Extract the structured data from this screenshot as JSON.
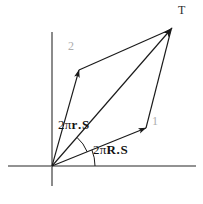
{
  "figure": {
    "name": "vector-parallelogram-diagram",
    "background": "#ffffff",
    "width": 203,
    "height": 204,
    "colors": {
      "axis": "#6e6e6e",
      "vector": "#1a1a1a",
      "arc": "#1a1a1a",
      "label_gray": "#adadad",
      "label_dark": "#111111"
    },
    "axes": {
      "origin": {
        "x": 52,
        "y": 166
      },
      "horizontal": {
        "x1": 8,
        "y1": 166,
        "x2": 196,
        "y2": 166
      },
      "vertical": {
        "x1": 52,
        "y1": 32,
        "x2": 52,
        "y2": 186
      }
    },
    "vectors": [
      {
        "id": "vector-1",
        "label": "1",
        "label_color": "#adadad",
        "from": {
          "x": 52,
          "y": 166
        },
        "to": {
          "x": 146,
          "y": 128
        }
      },
      {
        "id": "vector-2",
        "label": "2",
        "label_color": "#adadad",
        "from": {
          "x": 52,
          "y": 166
        },
        "to": {
          "x": 79,
          "y": 70
        }
      },
      {
        "id": "vector-T",
        "label": "T",
        "label_color": "#2b2b2b",
        "from": {
          "x": 52,
          "y": 166
        },
        "to": {
          "x": 172,
          "y": 28
        }
      }
    ],
    "parallelogram_edges": [
      {
        "id": "edge-2-to-T",
        "from": {
          "x": 79,
          "y": 70
        },
        "to": {
          "x": 172,
          "y": 28
        }
      },
      {
        "id": "edge-1-to-T",
        "from": {
          "x": 146,
          "y": 128
        },
        "to": {
          "x": 172,
          "y": 28
        }
      }
    ],
    "angles": [
      {
        "id": "angle-small",
        "label_parts": {
          "prefix": "2π",
          "first": "r",
          "dot": ".",
          "second": "S"
        },
        "label_text": "2π r . S",
        "arc_radius": 38,
        "from_deg": 22,
        "to_deg": 49
      },
      {
        "id": "angle-large",
        "label_parts": {
          "prefix": "2π",
          "first": "R",
          "dot": ".",
          "second": "S"
        },
        "label_text": "2π R . S",
        "arc_radius": 43,
        "from_deg": 0,
        "to_deg": 22
      }
    ]
  }
}
